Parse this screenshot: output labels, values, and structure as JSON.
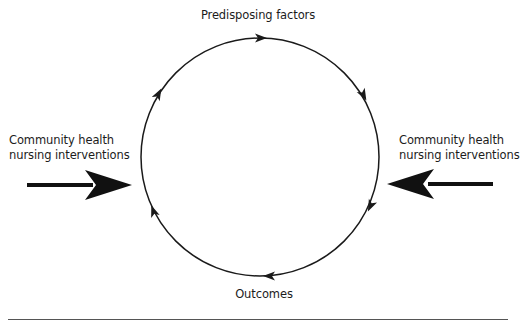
{
  "diagram": {
    "type": "cycle",
    "cycle_nodes": {
      "top": "Predisposing factors",
      "bottom": "Outcomes"
    },
    "inputs": {
      "left": {
        "line1": "Community health",
        "line2": "nursing interventions"
      },
      "right": {
        "line1": "Community health",
        "line2": "nursing interventions"
      }
    },
    "cycle_direction": "clockwise",
    "colors": {
      "stroke": "#1a1a1a",
      "background": "#ffffff",
      "rule": "#555555"
    }
  }
}
